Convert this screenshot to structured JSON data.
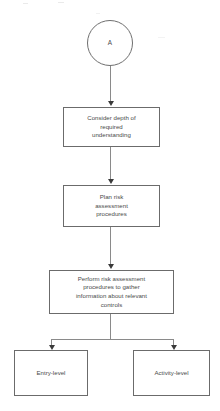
{
  "diagram": {
    "background_color": "#ffffff",
    "line_color": "#8a8a8a",
    "border_color": "#6b6b6b",
    "text_color": "#4a4a4a",
    "arrow_color": "#3a3a3a"
  },
  "nodes": {
    "connector_a": {
      "label": "A",
      "shape": "circle"
    },
    "step_1": {
      "label": "Consider depth of\nrequired\nunderstanding",
      "shape": "rectangle"
    },
    "step_2": {
      "label": "Plan risk\nassessment\nprocedures",
      "shape": "rectangle"
    },
    "step_3": {
      "label": "Perform risk assessment\nprocedures to gather\ninformation about relevant\ncontrols",
      "shape": "rectangle"
    },
    "branch_left": {
      "label": "Entry-level",
      "shape": "rectangle"
    },
    "branch_right": {
      "label": "Activity-level",
      "shape": "rectangle"
    }
  },
  "edges": [
    {
      "from": "connector_a",
      "to": "step_1",
      "type": "arrow-down"
    },
    {
      "from": "step_1",
      "to": "step_2",
      "type": "arrow-down"
    },
    {
      "from": "step_2",
      "to": "step_3",
      "type": "arrow-down"
    },
    {
      "from": "step_3",
      "to": "branch_left",
      "type": "arrow-split-left"
    },
    {
      "from": "step_3",
      "to": "branch_right",
      "type": "arrow-split-right"
    }
  ]
}
